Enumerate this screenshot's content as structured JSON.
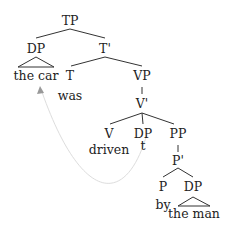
{
  "diagram": {
    "type": "syntax-tree",
    "nodes": {
      "tp": "TP",
      "dp_subject": "DP",
      "subject_words": "the car",
      "t_bar": "T'",
      "t": "T",
      "t_word": "was",
      "vp": "VP",
      "v_bar": "V'",
      "v": "V",
      "v_word": "driven",
      "dp_object": "DP",
      "trace": "t",
      "pp": "PP",
      "p_bar": "P'",
      "p": "P",
      "p_word": "by",
      "dp_by": "DP",
      "by_words": "the man"
    },
    "colors": {
      "lines": "#333333",
      "movement_arrow": "#dddddd",
      "arrowhead": "#999999"
    }
  }
}
